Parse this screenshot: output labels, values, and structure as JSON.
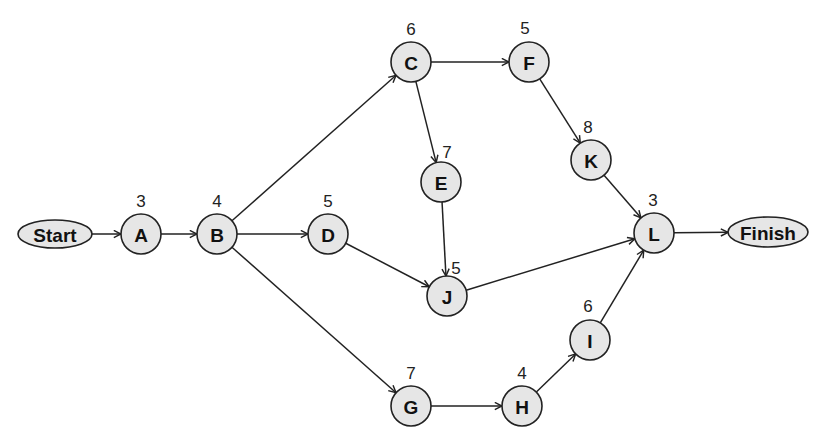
{
  "diagram": {
    "type": "activity-network",
    "nodes": [
      {
        "id": "Start",
        "label": "Start",
        "shape": "ellipse",
        "duration": null
      },
      {
        "id": "A",
        "label": "A",
        "shape": "circle",
        "duration": "3"
      },
      {
        "id": "B",
        "label": "B",
        "shape": "circle",
        "duration": "4"
      },
      {
        "id": "C",
        "label": "C",
        "shape": "circle",
        "duration": "6"
      },
      {
        "id": "D",
        "label": "D",
        "shape": "circle",
        "duration": "5"
      },
      {
        "id": "E",
        "label": "E",
        "shape": "circle",
        "duration": "7"
      },
      {
        "id": "F",
        "label": "F",
        "shape": "circle",
        "duration": "5"
      },
      {
        "id": "G",
        "label": "G",
        "shape": "circle",
        "duration": "7"
      },
      {
        "id": "H",
        "label": "H",
        "shape": "circle",
        "duration": "4"
      },
      {
        "id": "I",
        "label": "I",
        "shape": "circle",
        "duration": "6"
      },
      {
        "id": "J",
        "label": "J",
        "shape": "circle",
        "duration": "5"
      },
      {
        "id": "K",
        "label": "K",
        "shape": "circle",
        "duration": "8"
      },
      {
        "id": "L",
        "label": "L",
        "shape": "circle",
        "duration": "3"
      },
      {
        "id": "Finish",
        "label": "Finish",
        "shape": "ellipse",
        "duration": null
      }
    ],
    "edges": [
      [
        "Start",
        "A"
      ],
      [
        "A",
        "B"
      ],
      [
        "B",
        "C"
      ],
      [
        "B",
        "D"
      ],
      [
        "B",
        "G"
      ],
      [
        "C",
        "F"
      ],
      [
        "C",
        "E"
      ],
      [
        "F",
        "K"
      ],
      [
        "K",
        "L"
      ],
      [
        "E",
        "J"
      ],
      [
        "D",
        "J"
      ],
      [
        "J",
        "L"
      ],
      [
        "G",
        "H"
      ],
      [
        "H",
        "I"
      ],
      [
        "I",
        "L"
      ],
      [
        "L",
        "Finish"
      ]
    ]
  }
}
